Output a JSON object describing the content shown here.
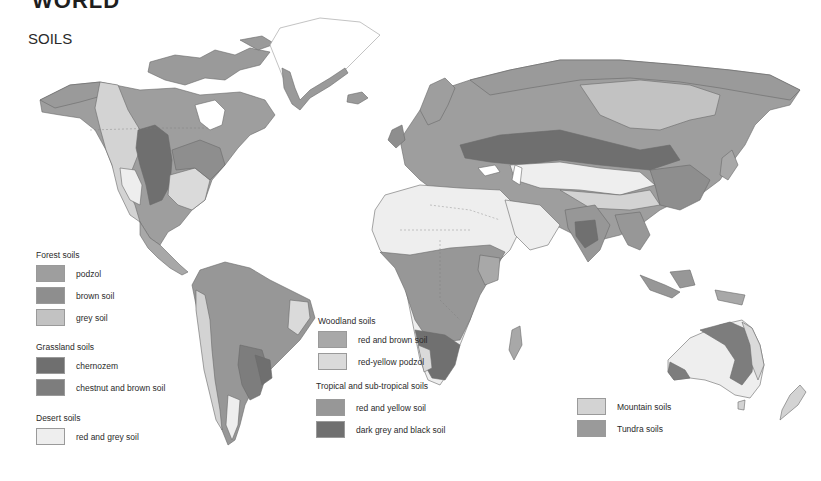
{
  "header": {
    "title": "WORLD",
    "subtitle": "SOILS"
  },
  "colors": {
    "ocean": "#ffffff",
    "ice": "#ffffff",
    "border": "#5a5a5a",
    "podzol": "#9e9e9e",
    "brown_soil": "#8e8e8e",
    "grey_soil": "#c2c2c2",
    "chernozem": "#6f6f6f",
    "chestnut_brown": "#7d7d7d",
    "red_grey_desert": "#eeeeee",
    "red_brown_woodland": "#a8a8a8",
    "red_yellow_podzol": "#dadada",
    "red_yellow_tropical": "#979797",
    "dark_grey_black": "#707070",
    "mountain": "#d3d3d3",
    "tundra": "#9a9a9a"
  },
  "legend": {
    "forest": {
      "heading": "Forest soils",
      "items": [
        {
          "label": "podzol",
          "color": "#9e9e9e"
        },
        {
          "label": "brown soil",
          "color": "#8e8e8e"
        },
        {
          "label": "grey soil",
          "color": "#c2c2c2"
        }
      ]
    },
    "grassland": {
      "heading": "Grassland soils",
      "items": [
        {
          "label": "chernozem",
          "color": "#6f6f6f"
        },
        {
          "label": "chestnut and brown soil",
          "color": "#7d7d7d"
        }
      ]
    },
    "desert": {
      "heading": "Desert soils",
      "items": [
        {
          "label": "red and grey soil",
          "color": "#eeeeee"
        }
      ]
    },
    "woodland": {
      "heading": "Woodland soils",
      "items": [
        {
          "label": "red and brown soil",
          "color": "#a8a8a8"
        },
        {
          "label": "red-yellow podzol",
          "color": "#dadada"
        }
      ]
    },
    "tropical": {
      "heading": "Tropical and sub-tropical soils",
      "items": [
        {
          "label": "red and yellow soil",
          "color": "#979797"
        },
        {
          "label": "dark grey and black soil",
          "color": "#707070"
        }
      ]
    },
    "other": {
      "items": [
        {
          "label": "Mountain soils",
          "color": "#d3d3d3"
        },
        {
          "label": "Tundra soils",
          "color": "#9a9a9a"
        }
      ]
    }
  }
}
